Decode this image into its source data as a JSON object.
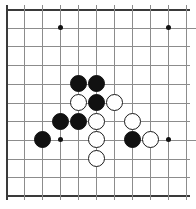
{
  "board": {
    "title": "Go board diagram",
    "type": "go-board-position",
    "columns": 11,
    "rows": 11,
    "origin_x": 6,
    "origin_y": 9,
    "spacing_x": 18,
    "spacing_y": 18.7,
    "colors": {
      "background": "#ffffff",
      "gridline": "#8c8c8c",
      "edge": "#3a3a3a",
      "black_stone": "#111111",
      "white_stone": "#ffffff",
      "white_stone_outline": "#1a1a1a"
    },
    "edges": {
      "left": "thick",
      "right": "thin",
      "top": "thin",
      "bottom": "thick"
    },
    "star_points": [
      {
        "col": 3,
        "row": 1
      },
      {
        "col": 9,
        "row": 1
      },
      {
        "col": 3,
        "row": 7
      },
      {
        "col": 9,
        "row": 7
      }
    ],
    "stones": [
      {
        "color": "black",
        "col": 4,
        "row": 4
      },
      {
        "color": "black",
        "col": 5,
        "row": 4
      },
      {
        "color": "white",
        "col": 4,
        "row": 5
      },
      {
        "color": "black",
        "col": 5,
        "row": 5
      },
      {
        "color": "white",
        "col": 6,
        "row": 5
      },
      {
        "color": "black",
        "col": 3,
        "row": 6
      },
      {
        "color": "black",
        "col": 4,
        "row": 6
      },
      {
        "color": "white",
        "col": 5,
        "row": 6
      },
      {
        "color": "white",
        "col": 7,
        "row": 6
      },
      {
        "color": "black",
        "col": 2,
        "row": 7
      },
      {
        "color": "white",
        "col": 5,
        "row": 7
      },
      {
        "color": "black",
        "col": 7,
        "row": 7
      },
      {
        "color": "white",
        "col": 8,
        "row": 7
      },
      {
        "color": "white",
        "col": 5,
        "row": 8
      }
    ],
    "stone_counts": {
      "black": 7,
      "white": 7
    }
  }
}
